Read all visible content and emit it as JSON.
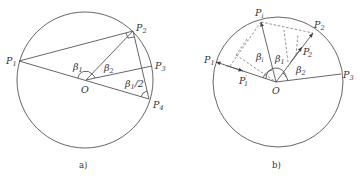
{
  "figures": [
    {
      "id": "a",
      "caption": "a)",
      "center_label": "O",
      "points": [
        {
          "name": "P",
          "sub": "1"
        },
        {
          "name": "P",
          "sub": "2"
        },
        {
          "name": "P",
          "sub": "3"
        },
        {
          "name": "P",
          "sub": "4"
        }
      ],
      "angles": [
        {
          "sym": "β",
          "sub": "1"
        },
        {
          "sym": "β",
          "sub": "2"
        },
        {
          "sym": "β",
          "sub": "1",
          "suffix": "/2"
        }
      ]
    },
    {
      "id": "b",
      "caption": "b)",
      "center_label": "O",
      "points": [
        {
          "name": "P",
          "sub": "1"
        },
        {
          "name": "P",
          "sub": "i"
        },
        {
          "name": "P",
          "sub": "2"
        },
        {
          "name": "P",
          "sub": "3"
        }
      ],
      "projections": [
        {
          "name": "P",
          "sup": "′",
          "sub": "1"
        },
        {
          "name": "P",
          "sup": "′",
          "sub": "2"
        }
      ],
      "angles": [
        {
          "sym": "β",
          "sub": "i"
        },
        {
          "sym": "β",
          "sub": "1"
        },
        {
          "sym": "β",
          "sub": "2"
        }
      ]
    }
  ]
}
